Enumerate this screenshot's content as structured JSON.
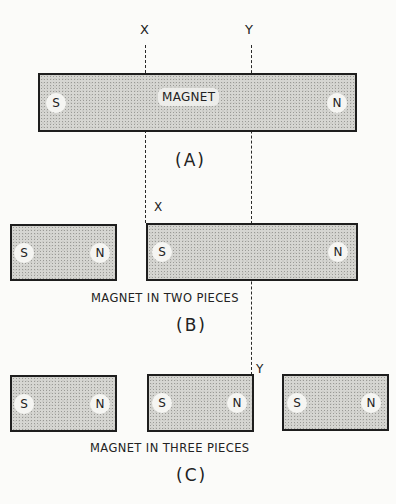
{
  "diagram": {
    "cut_lines": {
      "x_label": "X",
      "y_label": "Y"
    },
    "panel_a": {
      "magnet_label": "MAGNET",
      "poles": {
        "left": "S",
        "right": "N"
      },
      "figure_label": "(A)"
    },
    "panel_b": {
      "pieces": [
        {
          "left": "S",
          "right": "N"
        },
        {
          "left": "S",
          "right": "N"
        }
      ],
      "cut_label": "X",
      "caption": "MAGNET IN TWO PIECES",
      "figure_label": "(B)"
    },
    "panel_c": {
      "pieces": [
        {
          "left": "S",
          "right": "N"
        },
        {
          "left": "S",
          "right": "N"
        },
        {
          "left": "S",
          "right": "N"
        }
      ],
      "cut_label": "Y",
      "caption": "MAGNET IN THREE PIECES",
      "figure_label": "(C)"
    }
  }
}
